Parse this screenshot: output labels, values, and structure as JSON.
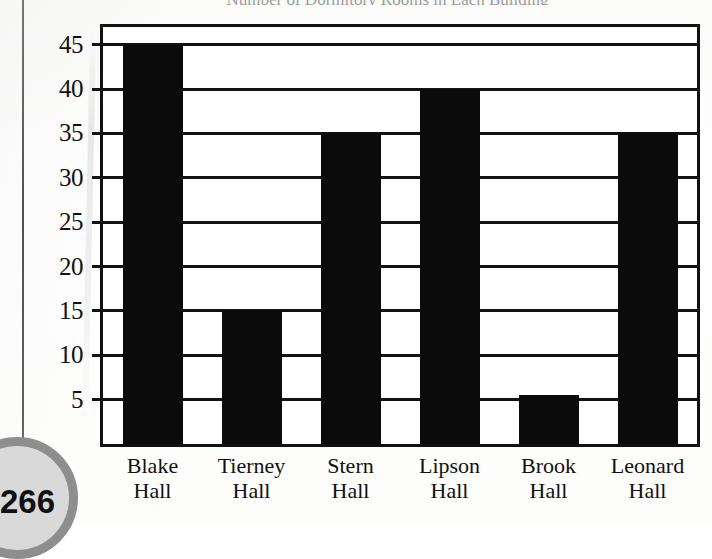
{
  "page": {
    "number": "266"
  },
  "chart_data": {
    "type": "bar",
    "title": "Number of Dormitory Rooms in Each Building",
    "xlabel": "",
    "ylabel": "",
    "categories": [
      "Blake Hall",
      "Tierney Hall",
      "Stern Hall",
      "Lipson Hall",
      "Brook Hall",
      "Leonard Hall"
    ],
    "category_lines": [
      [
        "Blake",
        "Hall"
      ],
      [
        "Tierney",
        "Hall"
      ],
      [
        "Stern",
        "Hall"
      ],
      [
        "Lipson",
        "Hall"
      ],
      [
        "Brook",
        "Hall"
      ],
      [
        "Leonard",
        "Hall"
      ]
    ],
    "values": [
      45,
      15,
      35,
      40,
      5.5,
      35
    ],
    "ylim": [
      0,
      47
    ],
    "yticks": [
      5,
      10,
      15,
      20,
      25,
      30,
      35,
      40,
      45
    ],
    "ytick_labels": [
      "5",
      "10",
      "15",
      "20",
      "25",
      "30",
      "35",
      "40",
      "45"
    ],
    "grid": true,
    "legend": false,
    "bar_color": "#0b0b0b",
    "frame_color": "#111111"
  }
}
